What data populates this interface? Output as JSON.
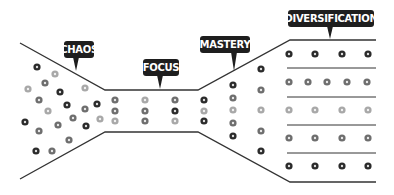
{
  "diagram": {
    "title": "",
    "stages": [
      {
        "id": "chaos",
        "label": "CHAOS",
        "box": {
          "x": 64,
          "y": 41,
          "w": 30,
          "h": 17
        },
        "pointer": {
          "x": 76,
          "y": 71
        }
      },
      {
        "id": "focus",
        "label": "FOCUS",
        "box": {
          "x": 143,
          "y": 59,
          "w": 36,
          "h": 17
        },
        "pointer": {
          "x": 160,
          "y": 89
        }
      },
      {
        "id": "mastery",
        "label": "MASTERY",
        "box": {
          "x": 200,
          "y": 36,
          "w": 50,
          "h": 17
        },
        "pointer": {
          "x": 234,
          "y": 71
        }
      },
      {
        "id": "diversification",
        "label": "DIVERSIFICATION",
        "box": {
          "x": 288,
          "y": 10,
          "w": 86,
          "h": 17
        },
        "pointer": {
          "x": 330,
          "y": 39
        }
      }
    ],
    "outline": {
      "top": [
        [
          20,
          43
        ],
        [
          105,
          90
        ],
        [
          198,
          90
        ],
        [
          290,
          40
        ],
        [
          376,
          40
        ]
      ],
      "bottom": [
        [
          20,
          179
        ],
        [
          105,
          132
        ],
        [
          198,
          132
        ],
        [
          290,
          182
        ],
        [
          376,
          182
        ]
      ],
      "separators_y": [
        68,
        97,
        125,
        153
      ],
      "separators_x": [
        287,
        376
      ],
      "stroke": "#333333"
    },
    "colors": {
      "dark": "#2b2b2b",
      "mid": "#6e6e6e",
      "light": "#a8a8a8",
      "label_bg": "#1e1e1e",
      "label_text": "#ffffff"
    },
    "dots": [
      {
        "x": 37,
        "y": 67,
        "c": "dark"
      },
      {
        "x": 55,
        "y": 74,
        "c": "light"
      },
      {
        "x": 45,
        "y": 83,
        "c": "mid"
      },
      {
        "x": 28,
        "y": 89,
        "c": "light"
      },
      {
        "x": 60,
        "y": 92,
        "c": "dark"
      },
      {
        "x": 85,
        "y": 88,
        "c": "light"
      },
      {
        "x": 39,
        "y": 100,
        "c": "mid"
      },
      {
        "x": 48,
        "y": 111,
        "c": "light"
      },
      {
        "x": 67,
        "y": 105,
        "c": "dark"
      },
      {
        "x": 85,
        "y": 109,
        "c": "mid"
      },
      {
        "x": 97,
        "y": 104,
        "c": "dark"
      },
      {
        "x": 25,
        "y": 122,
        "c": "dark"
      },
      {
        "x": 58,
        "y": 125,
        "c": "mid"
      },
      {
        "x": 73,
        "y": 118,
        "c": "mid"
      },
      {
        "x": 86,
        "y": 126,
        "c": "dark"
      },
      {
        "x": 100,
        "y": 119,
        "c": "light"
      },
      {
        "x": 39,
        "y": 131,
        "c": "mid"
      },
      {
        "x": 69,
        "y": 140,
        "c": "mid"
      },
      {
        "x": 36,
        "y": 151,
        "c": "dark"
      },
      {
        "x": 52,
        "y": 151,
        "c": "mid"
      },
      {
        "x": 115,
        "y": 100,
        "c": "mid"
      },
      {
        "x": 115,
        "y": 111,
        "c": "mid"
      },
      {
        "x": 115,
        "y": 121,
        "c": "light"
      },
      {
        "x": 145,
        "y": 100,
        "c": "light"
      },
      {
        "x": 145,
        "y": 111,
        "c": "mid"
      },
      {
        "x": 145,
        "y": 121,
        "c": "mid"
      },
      {
        "x": 175,
        "y": 100,
        "c": "mid"
      },
      {
        "x": 175,
        "y": 111,
        "c": "dark"
      },
      {
        "x": 175,
        "y": 121,
        "c": "light"
      },
      {
        "x": 204,
        "y": 100,
        "c": "dark"
      },
      {
        "x": 204,
        "y": 111,
        "c": "light"
      },
      {
        "x": 204,
        "y": 121,
        "c": "dark"
      },
      {
        "x": 233,
        "y": 85,
        "c": "dark"
      },
      {
        "x": 233,
        "y": 98,
        "c": "mid"
      },
      {
        "x": 233,
        "y": 110,
        "c": "light"
      },
      {
        "x": 233,
        "y": 123,
        "c": "mid"
      },
      {
        "x": 233,
        "y": 136,
        "c": "dark"
      },
      {
        "x": 261,
        "y": 69,
        "c": "dark"
      },
      {
        "x": 261,
        "y": 90,
        "c": "mid"
      },
      {
        "x": 261,
        "y": 110,
        "c": "light"
      },
      {
        "x": 261,
        "y": 131,
        "c": "mid"
      },
      {
        "x": 261,
        "y": 151,
        "c": "dark"
      },
      {
        "x": 289,
        "y": 54,
        "c": "dark"
      },
      {
        "x": 315,
        "y": 54,
        "c": "dark"
      },
      {
        "x": 342,
        "y": 54,
        "c": "dark"
      },
      {
        "x": 368,
        "y": 54,
        "c": "dark"
      },
      {
        "x": 289,
        "y": 82,
        "c": "mid"
      },
      {
        "x": 308,
        "y": 82,
        "c": "mid"
      },
      {
        "x": 327,
        "y": 82,
        "c": "mid"
      },
      {
        "x": 347,
        "y": 82,
        "c": "mid"
      },
      {
        "x": 367,
        "y": 82,
        "c": "mid"
      },
      {
        "x": 289,
        "y": 110,
        "c": "light"
      },
      {
        "x": 315,
        "y": 110,
        "c": "light"
      },
      {
        "x": 342,
        "y": 110,
        "c": "light"
      },
      {
        "x": 368,
        "y": 110,
        "c": "light"
      },
      {
        "x": 289,
        "y": 138,
        "c": "mid"
      },
      {
        "x": 315,
        "y": 138,
        "c": "mid"
      },
      {
        "x": 342,
        "y": 138,
        "c": "mid"
      },
      {
        "x": 368,
        "y": 138,
        "c": "mid"
      },
      {
        "x": 289,
        "y": 166,
        "c": "dark"
      },
      {
        "x": 315,
        "y": 166,
        "c": "dark"
      },
      {
        "x": 342,
        "y": 166,
        "c": "dark"
      },
      {
        "x": 368,
        "y": 166,
        "c": "dark"
      }
    ]
  }
}
